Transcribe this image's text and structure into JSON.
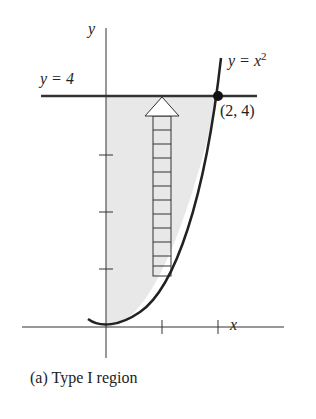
{
  "figure": {
    "caption": "(a) Type I region",
    "y_axis_label": "y",
    "x_axis_label": "x",
    "line_label": "y = 4",
    "curve_label_prefix": "y = x",
    "curve_label_exp": "2",
    "point_label": "(2, 4)",
    "region_fill": "#e8e8e8",
    "stroke_color": "#222222"
  }
}
